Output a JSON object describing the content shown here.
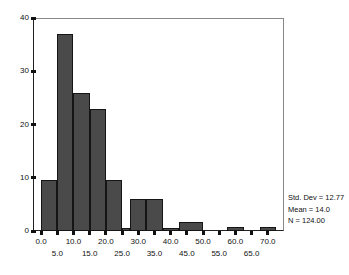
{
  "chart_data": {
    "type": "bar",
    "title": "",
    "subtitle": "",
    "xlabel": "",
    "ylabel": "",
    "xlim": [
      -2.5,
      75.0
    ],
    "ylim": [
      0,
      40
    ],
    "grid": false,
    "legend_position": "none",
    "bin_width": 5,
    "bar_color": "#4a4a4a",
    "bar_edge_color": "#151515",
    "y_ticks": [
      0,
      10,
      20,
      30,
      40
    ],
    "y_tick_labels": [
      "0",
      "10",
      "20",
      "30",
      "40"
    ],
    "x_ticks": [
      0.0,
      5.0,
      10.0,
      15.0,
      20.0,
      25.0,
      30.0,
      35.0,
      40.0,
      45.0,
      50.0,
      55.0,
      60.0,
      65.0,
      70.0
    ],
    "x_tick_labels_top": [
      "0.0",
      "10.0",
      "20.0",
      "30.0",
      "40.0",
      "50.0",
      "60.0",
      "70.0"
    ],
    "x_tick_labels_bottom": [
      "5.0",
      "15.0",
      "25.0",
      "35.0",
      "45.0",
      "55.0",
      "65.0"
    ],
    "x_tick_values_top": [
      0.0,
      10.0,
      20.0,
      30.0,
      40.0,
      50.0,
      60.0,
      70.0
    ],
    "x_tick_values_bottom": [
      5.0,
      15.0,
      25.0,
      35.0,
      45.0,
      55.0,
      65.0
    ],
    "bins": [
      {
        "start": 0.0,
        "end": 5.0,
        "value": 9.5
      },
      {
        "start": 5.0,
        "end": 10.0,
        "value": 37
      },
      {
        "start": 10.0,
        "end": 15.0,
        "value": 26
      },
      {
        "start": 15.0,
        "end": 20.0,
        "value": 23
      },
      {
        "start": 20.0,
        "end": 25.0,
        "value": 9.5
      },
      {
        "start": 25.0,
        "end": 27.5,
        "value": 0.5
      },
      {
        "start": 27.5,
        "end": 32.5,
        "value": 6
      },
      {
        "start": 32.5,
        "end": 37.5,
        "value": 6
      },
      {
        "start": 37.5,
        "end": 42.5,
        "value": 0.5
      },
      {
        "start": 42.5,
        "end": 50.0,
        "value": 1.7
      },
      {
        "start": 57.5,
        "end": 62.5,
        "value": 0.7
      },
      {
        "start": 67.5,
        "end": 72.5,
        "value": 0.7
      }
    ],
    "categories": [
      "0-5",
      "5-10",
      "10-15",
      "15-20",
      "20-25",
      "25-27.5",
      "27.5-32.5",
      "32.5-37.5",
      "37.5-42.5",
      "42.5-50",
      "57.5-62.5",
      "67.5-72.5"
    ],
    "values": [
      9.5,
      37,
      26,
      23,
      9.5,
      0.5,
      6,
      6,
      0.5,
      1.7,
      0.7,
      0.7
    ],
    "annotations": {
      "std_dev": "Std. Dev = 12.77",
      "mean": "Mean = 14.0",
      "n": "N = 124.00"
    }
  }
}
